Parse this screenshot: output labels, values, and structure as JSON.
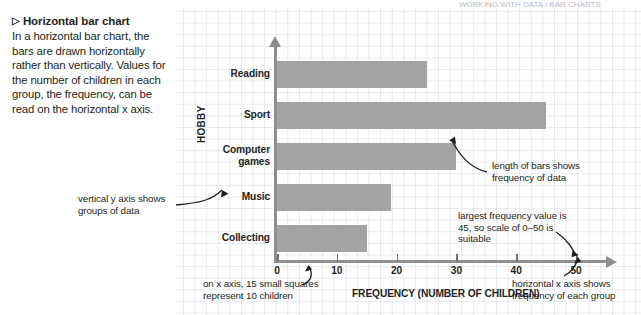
{
  "page": {
    "top_strip_text": "WORKING WITH DATA / BAR CHARTS"
  },
  "left_panel": {
    "marker": "▷",
    "heading": "Horizontal bar chart",
    "body": "In a horizontal bar chart, the bars are drawn horizontally rather than vertically. Values for the number of children in each group, the frequency, can be read on the horizontal x axis."
  },
  "annotations": {
    "y_axis": "vertical y axis shows groups of data",
    "bar_length": "length of bars shows frequency of data",
    "largest_value": "largest frequency value is 45, so scale of 0–50 is suitable",
    "x_small_squares": "on x axis, 15 small squares represent 10 children",
    "x_axis": "horizontal x axis shows frequency of each group"
  },
  "chart_data": {
    "type": "bar",
    "orientation": "horizontal",
    "title": "",
    "xlabel": "FREQUENCY (NUMBER OF CHILDREN)",
    "ylabel": "HOBBY",
    "categories": [
      "Reading",
      "Sport",
      "Computer games",
      "Music",
      "Collecting"
    ],
    "values": [
      25,
      45,
      30,
      19,
      15
    ],
    "xlim": [
      0,
      55
    ],
    "xticks": [
      0,
      10,
      20,
      30,
      40,
      50
    ],
    "xtick_labels": [
      "0",
      "10",
      "20",
      "30",
      "40",
      "50"
    ],
    "grid": true,
    "legend": "none",
    "bar_color": "#a3a3a3",
    "axis_color": "#8e8e8e"
  }
}
